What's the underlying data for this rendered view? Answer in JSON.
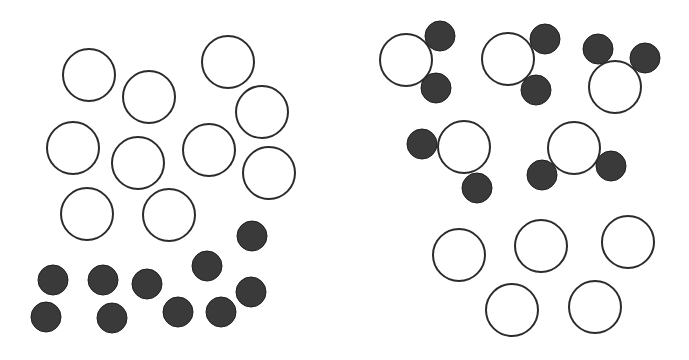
{
  "diagram": {
    "width": 689,
    "height": 360,
    "colors": {
      "open_fill": "#ffffff",
      "open_stroke": "#2b2b2b",
      "dark_fill": "#3a3a3a",
      "dark_stroke": "#1e1e1e",
      "background": "#ffffff"
    },
    "radii": {
      "open": 26,
      "dark": 15
    },
    "panels": [
      {
        "id": "left-panel",
        "description": "Separate particles: 10 open circles and 10 dark circles, unbound",
        "open_circles": [
          [
            89,
            75
          ],
          [
            149,
            97
          ],
          [
            228,
            62
          ],
          [
            262,
            112
          ],
          [
            73,
            148
          ],
          [
            138,
            163
          ],
          [
            209,
            150
          ],
          [
            269,
            173
          ],
          [
            87,
            214
          ],
          [
            169,
            215
          ]
        ],
        "dark_circles": [
          [
            252,
            236
          ],
          [
            207,
            266
          ],
          [
            53,
            280
          ],
          [
            103,
            280
          ],
          [
            147,
            284
          ],
          [
            251,
            292
          ],
          [
            46,
            317
          ],
          [
            112,
            318
          ],
          [
            178,
            312
          ],
          [
            221,
            312
          ]
        ]
      },
      {
        "id": "right-panel",
        "description": "Five molecules each of one open circle bonded to two dark circles, plus five leftover open circles",
        "molecules": [
          {
            "open": [
              406,
              60
            ],
            "dark": [
              [
                440,
                36
              ],
              [
                436,
                88
              ]
            ]
          },
          {
            "open": [
              508,
              59
            ],
            "dark": [
              [
                545,
                39
              ],
              [
                536,
                90
              ]
            ]
          },
          {
            "open": [
              615,
              87
            ],
            "dark": [
              [
                598,
                49
              ],
              [
                645,
                58
              ]
            ]
          },
          {
            "open": [
              464,
              147
            ],
            "dark": [
              [
                422,
                144
              ],
              [
                477,
                188
              ]
            ]
          },
          {
            "open": [
              574,
              148
            ],
            "dark": [
              [
                542,
                175
              ],
              [
                611,
                166
              ]
            ]
          }
        ],
        "open_circles": [
          [
            459,
            255
          ],
          [
            541,
            246
          ],
          [
            628,
            242
          ],
          [
            512,
            310
          ],
          [
            595,
            307
          ]
        ]
      }
    ]
  }
}
